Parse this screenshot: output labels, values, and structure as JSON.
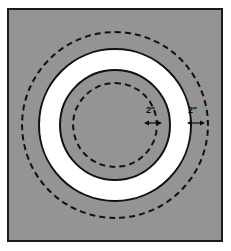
{
  "figure": {
    "name": "concentric-circles-dimension-diagram",
    "background_color": "#ffffff",
    "frame": {
      "border_color": "#1b1b1b",
      "fill_color": "#949494"
    },
    "shapes": {
      "outer_dashed_circle": {
        "style": "dashed",
        "color": "#111111"
      },
      "outer_solid_circle": {
        "style": "solid",
        "color": "#111111",
        "fill": "#ffffff"
      },
      "inner_solid_circle": {
        "style": "solid",
        "color": "#111111",
        "fill": "#949494"
      },
      "inner_dashed_circle": {
        "style": "dashed",
        "color": "#111111"
      }
    },
    "dimensions": [
      {
        "id": "inner-offset",
        "label": "2\"",
        "measures": "gap between inner dashed circle and inner solid circle"
      },
      {
        "id": "outer-offset",
        "label": "2\"",
        "measures": "gap between outer solid circle and outer dashed circle"
      }
    ]
  }
}
